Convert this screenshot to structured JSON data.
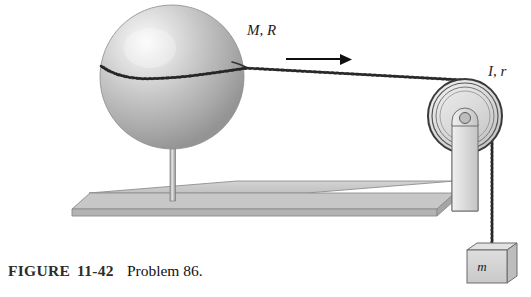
{
  "figure": {
    "caption": {
      "label": "FIGURE",
      "number": "11-42",
      "problem": "Problem 86."
    },
    "labels": {
      "sphere": "M, R",
      "pulley": "I, r",
      "hanging_mass": "m"
    },
    "elements": {
      "sphere_name": "sphere",
      "support_rod_name": "vertical-support-rod",
      "table_name": "table-surface",
      "cord_name": "cord",
      "arrow_name": "force-direction-arrow",
      "pulley_name": "pulley",
      "bracket_name": "pulley-bracket",
      "block_name": "hanging-block"
    },
    "colors": {
      "sphere_fill": "#b9b9b9",
      "sphere_highlight": "#f2f2f2",
      "table_fill": "#c9c9c9",
      "table_edge": "#a8a8a8",
      "pulley_fill": "#d9d9d9",
      "block_fill": "#d2d2d2",
      "line_stroke": "#2a2a2a"
    }
  }
}
